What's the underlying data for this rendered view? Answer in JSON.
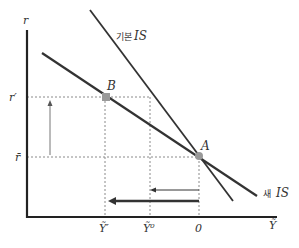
{
  "diagram": {
    "type": "economics-is-curve",
    "axes": {
      "y_label": "r",
      "x_label": "Ỹ"
    },
    "curves": {
      "basic_is": {
        "label_ko": "기본",
        "label_is": "IS"
      },
      "new_is": {
        "label_ko": "새",
        "label_is": "IS"
      }
    },
    "points": {
      "A": {
        "label": "A"
      },
      "B": {
        "label": "B"
      }
    },
    "y_ticks": {
      "r_prime": "r′",
      "r_bar": "r̄"
    },
    "x_ticks": {
      "y_prime": "Ỹ′",
      "y_zero": "Ỹ⁰",
      "zero": "0"
    },
    "colors": {
      "line": "#333333",
      "axis": "#222222",
      "dashed": "#888888",
      "point": "#999999",
      "arrow_up": "#777777"
    }
  }
}
